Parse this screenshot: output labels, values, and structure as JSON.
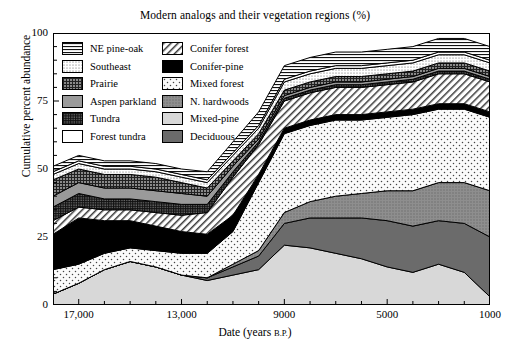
{
  "chart_data": {
    "type": "area",
    "title": "Modern analogs and their vegetation regions (%)",
    "xlabel": "Date (years B.P.)",
    "ylabel": "Cumulative percent abundance",
    "xlim": [
      18000,
      1000
    ],
    "ylim": [
      0,
      100
    ],
    "x_ticks": [
      17000,
      13000,
      9000,
      5000,
      1000
    ],
    "x_tick_labels": [
      "17,000",
      "13,000",
      "9000",
      "5000",
      "1000"
    ],
    "y_ticks": [
      0,
      25,
      50,
      75,
      100
    ],
    "y_tick_labels": [
      "0",
      "25",
      "50",
      "75",
      "100"
    ],
    "y_minor_tick_step": 5,
    "x_minor_tick_step": 1000,
    "grid": false,
    "legend_position": "upper-left-inside",
    "stacked": true,
    "x": [
      18000,
      17000,
      16000,
      15000,
      14000,
      13000,
      12000,
      11000,
      10000,
      9000,
      8000,
      7000,
      6000,
      5000,
      4000,
      3000,
      2000,
      1000
    ],
    "series": [
      {
        "name": "Mixed-pine",
        "pattern": "light-gray",
        "values": [
          4,
          8,
          13,
          16,
          14,
          11,
          9,
          11,
          13,
          22,
          21,
          19,
          17,
          14,
          12,
          15,
          12,
          3
        ]
      },
      {
        "name": "Deciduous",
        "pattern": "dark-gray",
        "values": [
          0,
          0,
          0,
          0,
          0,
          0,
          1,
          3,
          5,
          8,
          11,
          13,
          15,
          17,
          17,
          16,
          18,
          22
        ]
      },
      {
        "name": "N. hardwoods",
        "pattern": "medium-gray-textured",
        "values": [
          0,
          0,
          0,
          0,
          0,
          0,
          0,
          1,
          2,
          4,
          6,
          8,
          9,
          11,
          13,
          14,
          15,
          17
        ]
      },
      {
        "name": "Mixed forest",
        "pattern": "sparse-dots",
        "values": [
          9,
          7,
          6,
          5,
          6,
          8,
          9,
          12,
          25,
          29,
          28,
          28,
          27,
          27,
          28,
          27,
          27,
          27
        ]
      },
      {
        "name": "Conifer-pine",
        "pattern": "solid-black",
        "values": [
          13,
          17,
          12,
          10,
          9,
          8,
          7,
          6,
          3,
          2,
          2,
          2,
          2,
          2,
          2,
          2,
          2,
          2
        ]
      },
      {
        "name": "Conifer forest",
        "pattern": "diagonal-hatch",
        "values": [
          5,
          4,
          4,
          4,
          5,
          6,
          8,
          14,
          11,
          10,
          10,
          10,
          10,
          10,
          10,
          11,
          11,
          11
        ]
      },
      {
        "name": "Tundra",
        "pattern": "dense-grid-dark",
        "values": [
          5,
          5,
          4,
          4,
          4,
          4,
          3,
          2,
          1,
          1,
          1,
          1,
          1,
          1,
          1,
          1,
          1,
          1
        ]
      },
      {
        "name": "Aspen parkland",
        "pattern": "solid-gray",
        "values": [
          4,
          4,
          4,
          4,
          4,
          4,
          3,
          2,
          1,
          1,
          1,
          1,
          1,
          1,
          1,
          1,
          1,
          1
        ]
      },
      {
        "name": "Prairie",
        "pattern": "crosshatch-dark",
        "values": [
          6,
          5,
          5,
          5,
          5,
          4,
          3,
          2,
          2,
          2,
          2,
          2,
          2,
          2,
          2,
          2,
          2,
          2
        ]
      },
      {
        "name": "Southeast",
        "pattern": "fine-dots",
        "values": [
          2,
          2,
          2,
          2,
          2,
          2,
          2,
          2,
          2,
          3,
          3,
          3,
          3,
          3,
          3,
          3,
          3,
          3
        ]
      },
      {
        "name": "Forest tundra",
        "pattern": "white",
        "values": [
          1,
          1,
          1,
          1,
          1,
          1,
          1,
          1,
          1,
          1,
          1,
          1,
          1,
          1,
          1,
          1,
          1,
          1
        ]
      },
      {
        "name": "NE pine-oak",
        "pattern": "horizontal-lines",
        "values": [
          2,
          2,
          2,
          2,
          2,
          2,
          3,
          4,
          5,
          5,
          5,
          5,
          5,
          5,
          5,
          5,
          5,
          5
        ]
      }
    ]
  },
  "legend": {
    "columns": [
      {
        "items": [
          {
            "label": "NE pine-oak",
            "pattern": "horizontal-lines"
          },
          {
            "label": "Southeast",
            "pattern": "fine-dots"
          },
          {
            "label": "Prairie",
            "pattern": "crosshatch-dark"
          },
          {
            "label": "Aspen parkland",
            "pattern": "solid-gray"
          },
          {
            "label": "Tundra",
            "pattern": "dense-grid-dark"
          },
          {
            "label": "Forest tundra",
            "pattern": "white"
          }
        ]
      },
      {
        "items": [
          {
            "label": "Conifer forest",
            "pattern": "diagonal-hatch"
          },
          {
            "label": "Conifer-pine",
            "pattern": "solid-black"
          },
          {
            "label": "Mixed forest",
            "pattern": "sparse-dots"
          },
          {
            "label": "N. hardwoods",
            "pattern": "medium-gray-textured"
          },
          {
            "label": "Mixed-pine",
            "pattern": "light-gray"
          },
          {
            "label": "Deciduous",
            "pattern": "dark-gray"
          }
        ]
      }
    ]
  },
  "axis": {
    "x_label_main": "Date (years ",
    "x_label_bp": "B.P.",
    "x_label_tail": ")"
  }
}
